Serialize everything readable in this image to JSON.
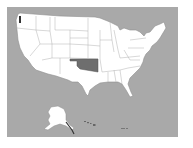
{
  "map": {
    "type": "us-states-choropleth",
    "highlighted_state": "Oklahoma",
    "colors": {
      "water": "#a9a9a9",
      "state_fill": "#ffffff",
      "state_border": "#9a9a9a",
      "highlight_fill": "#6e6e6e",
      "page_background": "#ffffff"
    },
    "insets": [
      "Alaska",
      "Hawaii"
    ]
  }
}
